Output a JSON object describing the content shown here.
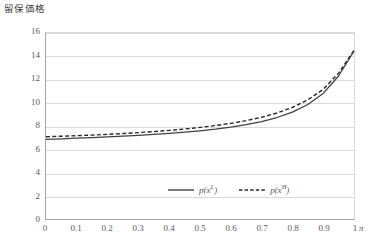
{
  "chart_title": "留保価格",
  "x_unit_label": "π",
  "colors": {
    "series_low": "#404040",
    "series_high": "#262626",
    "gridline": "#d9d9d9",
    "axis": "#a6a6a6",
    "text": "#595959"
  },
  "legend": {
    "position": "inside-bottom-center",
    "entries": [
      {
        "label_base": "p(x",
        "label_sup": "L",
        "label_close": ")",
        "style": "solid",
        "name": "p(x^L)"
      },
      {
        "label_base": "p(x",
        "label_sup": "H",
        "label_close": ")",
        "style": "dashed",
        "name": "p(x^H)"
      }
    ]
  },
  "chart_data": {
    "type": "line",
    "title": "留保価格",
    "xlabel": "π",
    "ylabel": "留保価格",
    "xlim": [
      0,
      1
    ],
    "ylim": [
      0,
      16
    ],
    "grid": true,
    "x_ticks": [
      "0",
      "0.1",
      "0.2",
      "0.3",
      "0.4",
      "0.5",
      "0.6",
      "0.7",
      "0.8",
      "0.9",
      "1"
    ],
    "y_ticks": [
      "0",
      "2",
      "4",
      "6",
      "8",
      "10",
      "12",
      "14",
      "16"
    ],
    "x": [
      0,
      0.05,
      0.1,
      0.15,
      0.2,
      0.25,
      0.3,
      0.35,
      0.4,
      0.45,
      0.5,
      0.55,
      0.6,
      0.65,
      0.7,
      0.75,
      0.8,
      0.85,
      0.9,
      0.95,
      1.0
    ],
    "series": [
      {
        "name": "p(x^L)",
        "style": "solid",
        "values": [
          6.85,
          6.9,
          6.95,
          7.0,
          7.06,
          7.13,
          7.2,
          7.28,
          7.37,
          7.47,
          7.59,
          7.73,
          7.9,
          8.11,
          8.38,
          8.73,
          9.2,
          9.85,
          10.8,
          12.3,
          14.45
        ]
      },
      {
        "name": "p(x^H)",
        "style": "dashed",
        "values": [
          7.08,
          7.12,
          7.17,
          7.22,
          7.28,
          7.35,
          7.43,
          7.52,
          7.62,
          7.74,
          7.88,
          8.04,
          8.23,
          8.46,
          8.75,
          9.12,
          9.6,
          10.25,
          11.15,
          12.55,
          14.5
        ]
      }
    ]
  }
}
